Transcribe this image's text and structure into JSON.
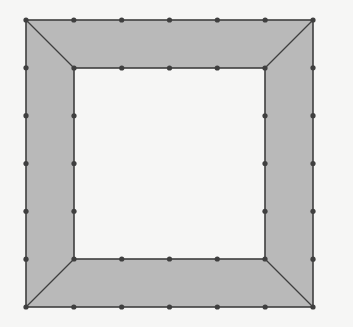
{
  "diagram": {
    "colors": {
      "background": "#f6f6f5",
      "fill": "#b9b9b9",
      "stroke": "#3f3f3f",
      "inner": "#f6f6f5"
    },
    "outer_square": {
      "x": 26,
      "y": 20,
      "size": 287,
      "points_per_side": 7
    },
    "inner_square": {
      "x": 74,
      "y": 68,
      "size": 191,
      "points_per_side": 5
    },
    "grid_spacing": 47.83,
    "regions": [
      {
        "name": "top-trapezoid"
      },
      {
        "name": "right-trapezoid"
      },
      {
        "name": "bottom-trapezoid"
      },
      {
        "name": "left-trapezoid"
      }
    ]
  }
}
